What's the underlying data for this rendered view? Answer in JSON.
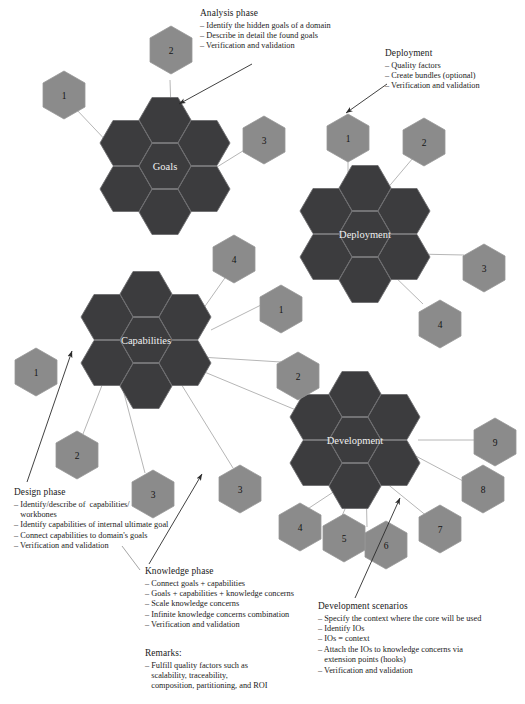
{
  "figure": {
    "colors": {
      "core_hex": "#3c3c3e",
      "core_hex_edge": "#6e6e70",
      "satellite_hex": "#8b8b8b",
      "satellite_hex_edge": "#9a9a9a",
      "connector_line": "#b3b3b3",
      "arrow": "#2b2b2b",
      "core_label_text": "#f2f2f2",
      "satellite_label_text": "#1a1a1a",
      "body_text": "#1b1b1b",
      "background": "#ffffff"
    }
  },
  "clusters": [
    {
      "id": "goals",
      "label": "Goals",
      "satellites": [
        "1",
        "2",
        "3"
      ]
    },
    {
      "id": "deployment",
      "label": "Deployment",
      "satellites": [
        "1",
        "2",
        "3",
        "4"
      ]
    },
    {
      "id": "capabilities",
      "label": "Capabilities",
      "satellites": [
        "4",
        "1",
        "2",
        "1",
        "2",
        "3",
        "3"
      ]
    },
    {
      "id": "development",
      "label": "Development",
      "satellites": [
        "9",
        "8",
        "7",
        "6",
        "5",
        "4"
      ]
    }
  ],
  "annotations": [
    {
      "id": "analysis-phase",
      "heading": "Analysis phase",
      "items": [
        "– Identify the hidden goals of a domain",
        "– Describe in detail the found goals",
        "– Verification and validation"
      ]
    },
    {
      "id": "deployment-phase",
      "heading": "Deployment",
      "items": [
        "– Quality factors",
        "– Create bundles (optional)",
        "– Verification and validation"
      ]
    },
    {
      "id": "design-phase",
      "heading": "Design phase",
      "items": [
        "– Identify/describe of  capabilities/",
        "   workbones",
        "– Identify capabilities of internal ultimate goal",
        "– Connect capabilities to domain's goals",
        "– Verification and validation"
      ]
    },
    {
      "id": "knowledge-phase",
      "heading": "Knowledge phase",
      "items": [
        "– Connect goals + capabilities",
        "– Goals + capabilities + knowledge concerns",
        "– Scale knowledge concerns",
        "– Infinite knowledge concerns combination",
        "– Verification and validation"
      ]
    },
    {
      "id": "remarks",
      "heading": "Remarks:",
      "items": [
        "– Fulfill quality factors such as",
        "   scalability, traceability,",
        "   composition, partitioning, and ROI"
      ]
    },
    {
      "id": "development-scenarios",
      "heading": "Development scenarios",
      "items": [
        "– Specify the context where the core will be used",
        "– Identify IOs",
        "– IOs = context",
        "– Attach the IOs to knowledge concerns via",
        "   extension points (hooks)",
        "– Verification and validation"
      ]
    }
  ],
  "hex_nodes": {
    "goals_sat_1": "1",
    "goals_sat_2": "2",
    "goals_sat_3": "3",
    "deploy_sat_1": "1",
    "deploy_sat_2": "2",
    "deploy_sat_3": "3",
    "deploy_sat_4": "4",
    "cap_sat_4": "4",
    "cap_sat_1r": "1",
    "cap_sat_2r": "2",
    "cap_sat_1l": "1",
    "cap_sat_2l": "2",
    "cap_sat_3a": "3",
    "cap_sat_3b": "3",
    "dev_sat_9": "9",
    "dev_sat_8": "8",
    "dev_sat_7": "7",
    "dev_sat_6": "6",
    "dev_sat_5": "5",
    "dev_sat_4": "4"
  },
  "core_labels": {
    "goals": "Goals",
    "deployment": "Deployment",
    "capabilities": "Capabilities",
    "development": "Development"
  }
}
